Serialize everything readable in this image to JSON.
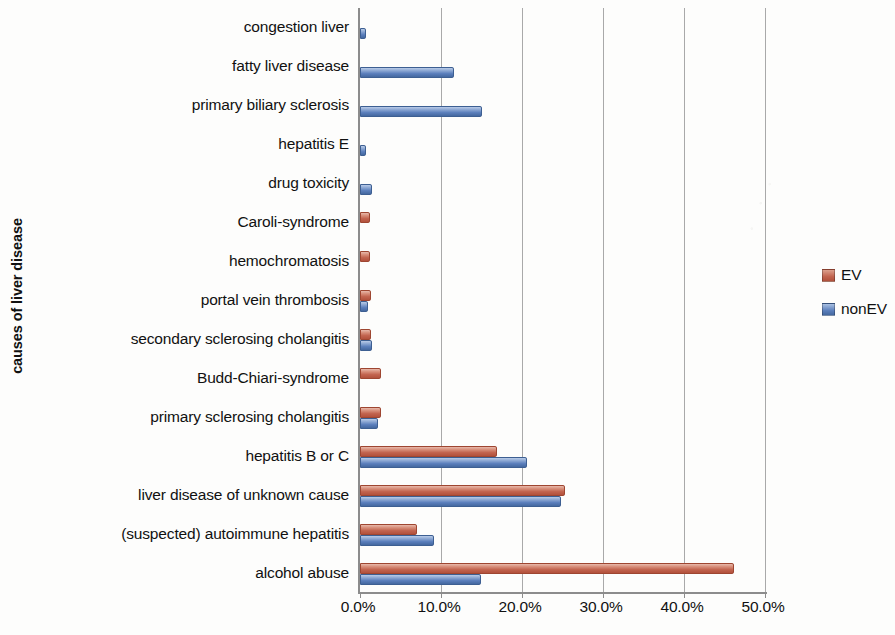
{
  "chart_data": {
    "type": "bar",
    "orientation": "horizontal",
    "title": "",
    "xlabel": "",
    "ylabel": "causes of liver disease",
    "xlim": [
      0,
      50
    ],
    "xticks": [
      "0.0%",
      "10.0%",
      "20.0%",
      "30.0%",
      "40.0%",
      "50.0%"
    ],
    "xtick_values": [
      0,
      10,
      20,
      30,
      40,
      50
    ],
    "grid": true,
    "legend_position": "right",
    "categories": [
      "congestion liver",
      "fatty liver disease",
      "primary biliary sclerosis",
      "hepatitis E",
      "drug toxicity",
      "Caroli-syndrome",
      "hemochromatosis",
      "portal vein thrombosis",
      "secondary sclerosing cholangitis",
      "Budd-Chiari-syndrome",
      "primary sclerosing cholangitis",
      "hepatitis B or C",
      "liver disease of unknown cause",
      "(suspected) autoimmune hepatitis",
      "alcohol abuse"
    ],
    "series": [
      {
        "name": "EV",
        "color": "#C2644F",
        "values": [
          0,
          0,
          0,
          0,
          0,
          1.0,
          1.0,
          1.1,
          1.1,
          2.3,
          2.3,
          16.7,
          25.1,
          6.8,
          45.9
        ]
      },
      {
        "name": "nonEV",
        "color": "#5B7FBC",
        "values": [
          0.5,
          11.3,
          14.8,
          0.5,
          1.2,
          0,
          0,
          0.8,
          1.2,
          0,
          2.0,
          20.4,
          24.6,
          8.9,
          14.7
        ]
      }
    ]
  },
  "axis": {
    "y_title": "causes of liver disease",
    "x_tick_labels": [
      "0.0%",
      "10.0%",
      "20.0%",
      "30.0%",
      "40.0%",
      "50.0%"
    ]
  },
  "legend": {
    "items": [
      {
        "label": "EV",
        "color": "#C2644F"
      },
      {
        "label": "nonEV",
        "color": "#5B7FBC"
      }
    ]
  }
}
